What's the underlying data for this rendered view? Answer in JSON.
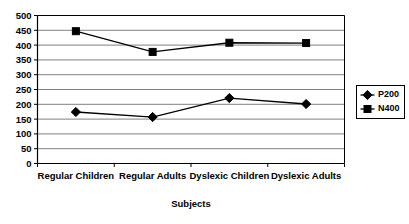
{
  "chart_data": {
    "type": "line",
    "title": "",
    "xlabel": "Subjects",
    "ylabel": "",
    "categories": [
      "Regular Children",
      "Regular Adults",
      "Dyslexic Children",
      "Dyslexic Adults"
    ],
    "series": [
      {
        "name": "P200",
        "marker": "diamond",
        "color": "#000000",
        "values": [
          174,
          157,
          221,
          201
        ]
      },
      {
        "name": "N400",
        "marker": "square",
        "color": "#000000",
        "values": [
          447,
          377,
          408,
          407
        ]
      }
    ],
    "ylim": [
      0,
      500
    ],
    "ytick_step": 50,
    "yticks": [
      0,
      50,
      100,
      150,
      200,
      250,
      300,
      350,
      400,
      450,
      500
    ],
    "ytick_labels": [
      "0",
      "50",
      "100",
      "150",
      "200",
      "250",
      "300",
      "350",
      "400",
      "450",
      "500"
    ],
    "grid": "horizontal",
    "legend_position": "right",
    "plot_background": "#ffffff",
    "axis_color": "#000000",
    "grid_color": "#808080"
  },
  "legend": {
    "entries": [
      {
        "label": "P200",
        "marker": "diamond"
      },
      {
        "label": "N400",
        "marker": "square"
      }
    ]
  }
}
